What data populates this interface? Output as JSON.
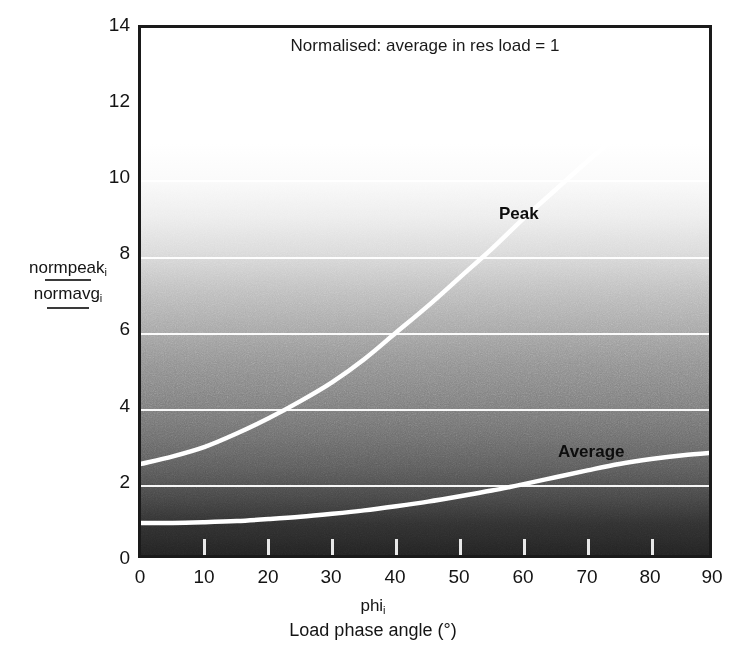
{
  "chart_data": {
    "type": "line",
    "title": "Normalised: average in res load = 1",
    "xlabel_symbol": "phi",
    "xlabel_symbol_sub": "i",
    "xlabel": "Load phase angle (°)",
    "xlabel_unit": "°",
    "ylabel_numerator": "normpeak",
    "ylabel_numerator_sub": "i",
    "ylabel_denominator": "normavg",
    "ylabel_denominator_sub": "i",
    "xlim": [
      0,
      90
    ],
    "ylim": [
      0,
      14
    ],
    "xticks": [
      0,
      10,
      20,
      30,
      40,
      50,
      60,
      70,
      80,
      90
    ],
    "yticks": [
      0,
      2,
      4,
      6,
      8,
      10,
      12,
      14
    ],
    "gridlines_y": [
      2,
      4,
      6,
      8,
      10
    ],
    "grid": true,
    "legend_position": "inline-annotations",
    "background": "vertical grayscale gradient, white at top to black at bottom",
    "curve_color": "#ffffff",
    "x": [
      0,
      5,
      10,
      15,
      20,
      25,
      30,
      35,
      40,
      45,
      50,
      55,
      60,
      65,
      70,
      75,
      80,
      85,
      90
    ],
    "series": [
      {
        "name": "Peak",
        "values": [
          2.55,
          2.75,
          3.0,
          3.35,
          3.75,
          4.2,
          4.7,
          5.3,
          6.0,
          6.7,
          7.45,
          8.2,
          9.0,
          9.75,
          10.5,
          11.2,
          11.9,
          12.5,
          13.0
        ]
      },
      {
        "name": "Average",
        "values": [
          1.0,
          1.0,
          1.02,
          1.05,
          1.1,
          1.16,
          1.24,
          1.33,
          1.44,
          1.56,
          1.7,
          1.85,
          2.02,
          2.2,
          2.38,
          2.55,
          2.68,
          2.78,
          2.85
        ]
      }
    ],
    "annotations": [
      {
        "text": "Peak",
        "x": 47,
        "y": 9.3
      },
      {
        "text": "Average",
        "x": 73,
        "y": 2.85
      }
    ]
  }
}
